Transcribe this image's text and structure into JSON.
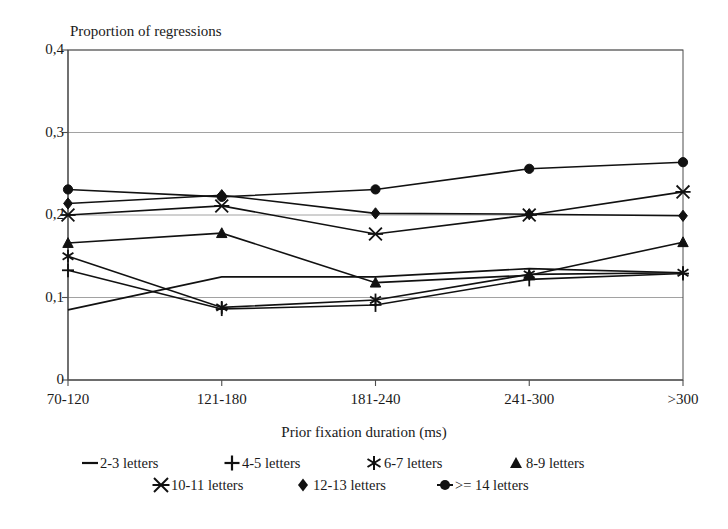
{
  "chart_data": {
    "type": "line",
    "title": "Proportion of regressions",
    "xlabel": "Prior fixation duration (ms)",
    "ylabel": "",
    "categories": [
      "70-120",
      "121-180",
      "181-240",
      "241-300",
      ">300"
    ],
    "ytick_labels": [
      "0,4",
      "0,3",
      "0,2",
      "0,1",
      "0"
    ],
    "ytick_values": [
      0.4,
      0.3,
      0.2,
      0.1,
      0
    ],
    "ylim": [
      0,
      0.4
    ],
    "grid": "horizontal",
    "legend_position": "bottom",
    "series": [
      {
        "name": "2-3 letters",
        "marker": "dash",
        "values": [
          0.085,
          0.125,
          0.125,
          0.135,
          0.13
        ]
      },
      {
        "name": "4-5 letters",
        "marker": "plus",
        "values": [
          0.133,
          0.086,
          0.091,
          0.122,
          0.129
        ]
      },
      {
        "name": "6-7 letters",
        "marker": "asterisk",
        "values": [
          0.15,
          0.088,
          0.097,
          0.128,
          0.13
        ]
      },
      {
        "name": "8-9 letters",
        "marker": "triangle",
        "values": [
          0.166,
          0.178,
          0.118,
          0.127,
          0.167
        ]
      },
      {
        "name": "10-11 letters",
        "marker": "x-star",
        "values": [
          0.2,
          0.211,
          0.177,
          0.2,
          0.228
        ]
      },
      {
        "name": "12-13 letters",
        "marker": "diamond",
        "values": [
          0.214,
          0.224,
          0.202,
          0.201,
          0.199
        ]
      },
      {
        "name": ">= 14 letters",
        "marker": "circle",
        "values": [
          0.231,
          0.222,
          0.231,
          0.256,
          0.264
        ]
      }
    ]
  },
  "chart": {
    "title": "Proportion of regressions",
    "x_axis_title": "Prior fixation duration (ms)",
    "x_labels": [
      "70-120",
      "121-180",
      "181-240",
      "241-300",
      ">300"
    ],
    "y_labels": [
      "0,4",
      "0,3",
      "0,2",
      "0,1",
      "0"
    ]
  },
  "legend": {
    "row1": [
      {
        "label": "2-3 letters",
        "marker": "dash-marker"
      },
      {
        "label": "4-5 letters",
        "marker": "plus-marker"
      },
      {
        "label": "6-7 letters",
        "marker": "asterisk-marker"
      },
      {
        "label": "8-9 letters",
        "marker": "triangle-marker"
      }
    ],
    "row2": [
      {
        "label": "10-11 letters",
        "marker": "x-star-marker"
      },
      {
        "label": "12-13 letters",
        "marker": "diamond-marker"
      },
      {
        "label": ">= 14 letters",
        "marker": "circle-marker"
      }
    ]
  },
  "colors": {
    "ink": "#111111",
    "grid": "#8a8a8a",
    "frame": "#4d4d4d",
    "background": "#ffffff"
  }
}
